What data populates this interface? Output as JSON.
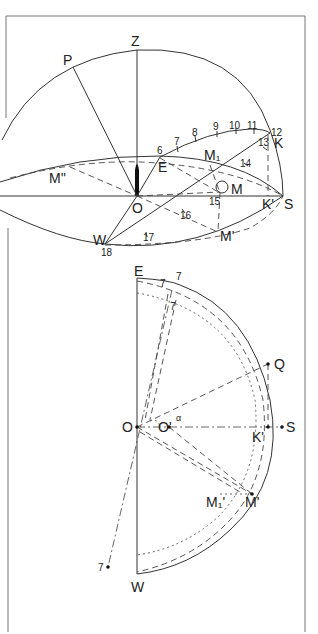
{
  "figure": {
    "top_diagram": {
      "points": {
        "Z": "Z",
        "P": "P",
        "E": "E",
        "O": "O",
        "S": "S",
        "W": "W",
        "K": "K",
        "K_prime": "K'",
        "M": "M",
        "M1": "M₁",
        "M_prime": "M'",
        "M_double_prime": "M''"
      },
      "hour_marks": [
        "6",
        "7",
        "8",
        "9",
        "10",
        "11",
        "12",
        "13",
        "14",
        "15",
        "16",
        "17",
        "18"
      ]
    },
    "bottom_diagram": {
      "points": {
        "E": "E",
        "O": "O",
        "O_prime": "O'",
        "K_prime": "K'",
        "S": "S",
        "Q": "Q",
        "W": "W",
        "M_prime": "M'",
        "M1_prime": "M₁'",
        "alpha": "α"
      },
      "hour_marks": [
        "7",
        "7",
        "7",
        "7"
      ]
    }
  }
}
